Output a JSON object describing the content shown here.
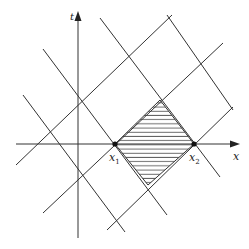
{
  "diagram": {
    "type": "characteristics-diagram",
    "axes": {
      "x_label": "x",
      "t_label": "t"
    },
    "points": [
      {
        "name": "x1",
        "label_base": "x",
        "label_sub": "1",
        "x": 115,
        "y": 144
      },
      {
        "name": "x2",
        "label_base": "x",
        "label_sub": "2",
        "x": 194,
        "y": 144
      }
    ],
    "lines_negative_slope": [
      {
        "x1": 23,
        "y1": 95,
        "x2": 125,
        "y2": 232
      },
      {
        "x1": 43,
        "y1": 49,
        "x2": 167,
        "y2": 215
      },
      {
        "x1": 100,
        "y1": 18,
        "x2": 220,
        "y2": 177
      },
      {
        "x1": 167,
        "y1": 15,
        "x2": 233,
        "y2": 110
      }
    ],
    "lines_positive_slope": [
      {
        "x1": 16,
        "y1": 165,
        "x2": 172,
        "y2": 15
      },
      {
        "x1": 43,
        "y1": 213,
        "x2": 223,
        "y2": 43
      },
      {
        "x1": 107,
        "y1": 230,
        "x2": 233,
        "y2": 107
      }
    ],
    "shaded_region": {
      "shape": "diamond",
      "vertices": [
        [
          115,
          144
        ],
        [
          160,
          100
        ],
        [
          194,
          144
        ],
        [
          148,
          185
        ]
      ],
      "fill": "horizontal-hatching"
    },
    "colors": {
      "line": "#333333",
      "background": "#ffffff"
    }
  }
}
